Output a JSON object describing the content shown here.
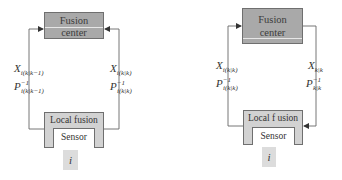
{
  "diagrams": [
    {
      "id": "left",
      "fusion_center": {
        "line1": "Fusion",
        "line2": "center"
      },
      "local_fusion": {
        "label": "Local fusion"
      },
      "sensor": {
        "label": "Sensor"
      },
      "node_index": "i",
      "left_channel": {
        "state": {
          "base": "X",
          "sub": "i(k|k−1)"
        },
        "cov": {
          "base": "P",
          "sup": "−1",
          "sub": "i(k|k−1)"
        },
        "direction": "local-to-center"
      },
      "right_channel": {
        "state": {
          "base": "X",
          "sub": "i(k|k)"
        },
        "cov": {
          "base": "P",
          "sup": "−1",
          "sub": "i(k|k)"
        },
        "direction": "local-to-center"
      }
    },
    {
      "id": "right",
      "fusion_center": {
        "line1": "Fusion",
        "line2": "center"
      },
      "local_fusion": {
        "label": "Local f usion"
      },
      "sensor": {
        "label": "Sensor"
      },
      "node_index": "i",
      "left_channel": {
        "state": {
          "base": "X",
          "sub": "i(k|k)"
        },
        "cov": {
          "base": "P",
          "sup": "−1",
          "sub": "i(k|k)"
        },
        "direction": "local-to-center"
      },
      "right_channel": {
        "state": {
          "base": "X",
          "sub": "k|k"
        },
        "cov": {
          "base": "P",
          "sup": "−1",
          "sub": "k|k"
        },
        "direction": "center-to-local"
      }
    }
  ],
  "colors": {
    "fusion_center_fill": "#a9a9a9",
    "local_fusion_fill": "#d2d2d2",
    "sensor_fill": "#ffffff",
    "index_fill": "#dcdcdc",
    "line": "#555555"
  }
}
